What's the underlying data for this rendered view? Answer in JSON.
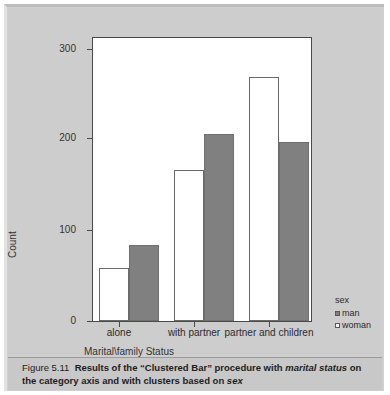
{
  "figure": {
    "number_label": "Figure 5.11",
    "caption_part1": "Results of the “Clustered Bar” procedure with ",
    "caption_em1": "marital status",
    "caption_part2": " on the category axis and with clusters based on ",
    "caption_em2": "sex"
  },
  "legend": {
    "title": "sex",
    "items": [
      {
        "label": "man",
        "swatch": "filled-gray-square",
        "color": "#808080"
      },
      {
        "label": "woman",
        "swatch": "open-white-square",
        "color": "#ffffff"
      }
    ]
  },
  "axes": {
    "y_title": "Count",
    "x_title": "Marital\\family Status"
  },
  "chart_data": {
    "type": "bar",
    "title": "",
    "xlabel": "Marital\\family Status",
    "ylabel": "Count",
    "categories": [
      "alone",
      "with partner",
      "partner and children"
    ],
    "series": [
      {
        "name": "woman",
        "values": [
          58,
          165,
          267
        ],
        "color": "#ffffff"
      },
      {
        "name": "man",
        "values": [
          83,
          205,
          196
        ],
        "color": "#808080"
      }
    ],
    "series_order_in_cluster": [
      "woman",
      "man"
    ],
    "ylim": [
      0,
      310
    ],
    "yticks": [
      0,
      100,
      200,
      300
    ],
    "ytick_labels": [
      "0",
      "100",
      "200",
      "300"
    ],
    "grid": false,
    "legend_position": "right-bottom",
    "legend_title": "sex"
  }
}
